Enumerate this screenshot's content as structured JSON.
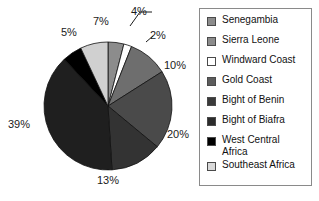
{
  "chart_data": {
    "type": "pie",
    "title": "",
    "xlabel": "",
    "ylabel": "",
    "legend_position": "right",
    "grid": false,
    "start_angle_deg": 0,
    "direction": "clockwise",
    "categories": [
      "Senegambia",
      "Sierra Leone",
      "Windward Coast",
      "Gold Coast",
      "Bight of Benin",
      "Bight of Biafra",
      "West Central Africa",
      "Southeast Africa"
    ],
    "values": [
      4,
      2,
      10,
      20,
      13,
      39,
      5,
      7
    ],
    "value_labels": [
      "4%",
      "2%",
      "10%",
      "20%",
      "13%",
      "39%",
      "5%",
      "7%"
    ],
    "colors": [
      "#8c8c8c",
      "#ffffff",
      "#6e6e6e",
      "#4a4a4a",
      "#333333",
      "#1f1f1f",
      "#000000",
      "#d0d0d0"
    ],
    "slice_order_clockwise_from_top": [
      "Senegambia",
      "Sierra Leone",
      "Windward Coast",
      "Gold Coast",
      "Bight of Benin",
      "Bight of Biafra",
      "West Central Africa",
      "Southeast Africa"
    ]
  },
  "pie": {
    "labels": [
      {
        "text": "4%",
        "left": 131,
        "top": 5
      },
      {
        "text": "2%",
        "left": 150,
        "top": 29
      },
      {
        "text": "10%",
        "left": 164,
        "top": 59
      },
      {
        "text": "20%",
        "left": 167,
        "top": 128
      },
      {
        "text": "13%",
        "left": 97,
        "top": 174
      },
      {
        "text": "39%",
        "left": 8,
        "top": 118
      },
      {
        "text": "5%",
        "left": 61,
        "top": 26
      },
      {
        "text": "7%",
        "left": 93,
        "top": 15
      }
    ]
  },
  "legend": {
    "items": [
      {
        "label": "Senegambia",
        "color": "#8c8c8c"
      },
      {
        "label": "Sierra Leone",
        "color": "#8c8c8c"
      },
      {
        "label": "Windward Coast",
        "color": "#ffffff"
      },
      {
        "label": "Gold Coast",
        "color": "#5c5c5c"
      },
      {
        "label": "Bight of Benin",
        "color": "#3a3a3a"
      },
      {
        "label": "Bight of Biafra",
        "color": "#2b2b2b"
      },
      {
        "label": "West Central Africa",
        "color": "#000000"
      },
      {
        "label": "Southeast Africa",
        "color": "#d9d9d9"
      }
    ]
  }
}
